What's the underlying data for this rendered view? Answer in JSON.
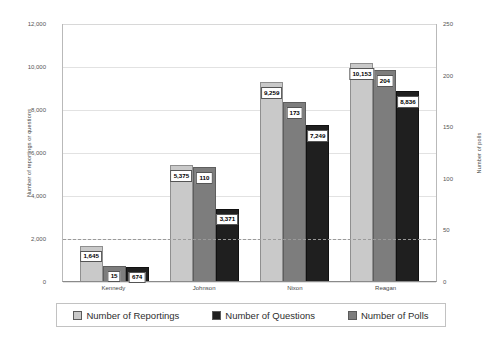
{
  "chart_data": {
    "type": "bar",
    "title": "",
    "subtitle": "",
    "categories": [
      "Kennedy",
      "Johnson",
      "Nixon",
      "Reagan"
    ],
    "series": [
      {
        "name": "Number of Reportings",
        "axis": "left",
        "color": "#c9c9c9",
        "values": [
          1645,
          5375,
          9259,
          10153
        ],
        "labels": [
          "1,645",
          "5,375",
          "9,259",
          "10,153"
        ]
      },
      {
        "name": "Number of Questions",
        "axis": "right",
        "color": "#7d7d7d",
        "values": [
          15,
          110,
          173,
          204
        ],
        "labels": [
          "15",
          "110",
          "173",
          "204"
        ]
      },
      {
        "name": "Number of Polls",
        "axis": "left",
        "color": "#1f1f1f",
        "values": [
          674,
          3371,
          7249,
          8836
        ],
        "labels": [
          "674",
          "3,371",
          "7,249",
          "8,836"
        ]
      }
    ],
    "xlabel": "",
    "ylabel": "Number of reportings or questions",
    "y2label": "Number of polls",
    "ylim": [
      0,
      12000
    ],
    "y2lim": [
      0,
      250
    ],
    "yticks": [
      "0",
      "2,000",
      "4,000",
      "6,000",
      "8,000",
      "10,000",
      "12,000"
    ],
    "ytick_values": [
      0,
      2000,
      4000,
      6000,
      8000,
      10000,
      12000
    ],
    "y2ticks": [
      "0",
      "50",
      "100",
      "150",
      "200",
      "250"
    ],
    "y2tick_values": [
      0,
      50,
      100,
      150,
      200,
      250
    ],
    "reference_line": {
      "left_value": 2000,
      "right_value": 40
    },
    "grid": true,
    "legend_position": "bottom"
  },
  "legend": {
    "items": [
      {
        "label": "Number of Reportings"
      },
      {
        "label": "Number of Questions"
      },
      {
        "label": "Number of Polls"
      }
    ]
  }
}
